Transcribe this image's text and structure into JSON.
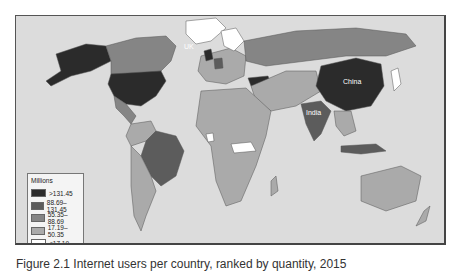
{
  "map": {
    "labels": {
      "uk": "UK",
      "china": "China",
      "india": "India"
    },
    "colors": {
      "ocean": "#dcdcdc",
      "cat1": "#2b2b2b",
      "cat2": "#5c5c5c",
      "cat3": "#858585",
      "cat4": "#aaaaaa",
      "cat5": "#ffffff",
      "border": "#555555"
    }
  },
  "legend": {
    "title": "Millions",
    "items": [
      {
        "label": ">131.45",
        "color": "#2b2b2b"
      },
      {
        "label": "88.69–131.45",
        "color": "#5c5c5c"
      },
      {
        "label": "55.35–88.69",
        "color": "#858585"
      },
      {
        "label": "17.19–50.35",
        "color": "#aaaaaa"
      },
      {
        "label": "<17.19",
        "color": "#ffffff"
      }
    ]
  },
  "caption": "Figure 2.1 Internet users per country, ranked by quantity, 2015"
}
